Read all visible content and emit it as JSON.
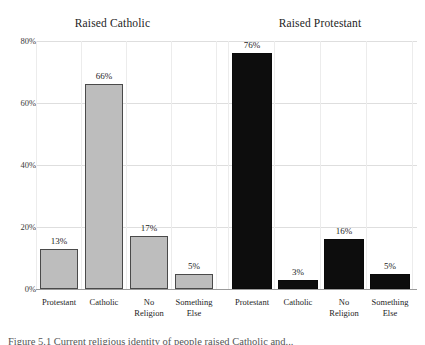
{
  "figure": {
    "caption": "Figure 5.1  Current religious identity of people raised Catholic and..."
  },
  "chart_data": {
    "type": "bar",
    "title": "",
    "xlabel": "",
    "ylabel": "",
    "ylim": [
      0,
      80
    ],
    "yticks": [
      "0%",
      "20%",
      "40%",
      "60%",
      "80%"
    ],
    "ytick_values": [
      0,
      20,
      40,
      60,
      80
    ],
    "grid": true,
    "grid_axis": "both",
    "legend": "none",
    "panels": [
      {
        "title": "Raised Catholic",
        "bar_color": "#bdbdbd",
        "categories": [
          "Protestant",
          "Catholic",
          "No Religion",
          "Something Else"
        ],
        "category_lines": [
          [
            "Protestant"
          ],
          [
            "Catholic"
          ],
          [
            "No",
            "Religion"
          ],
          [
            "Something",
            "Else"
          ]
        ],
        "values": [
          13,
          66,
          17,
          5
        ],
        "labels": [
          "13%",
          "66%",
          "17%",
          "5%"
        ]
      },
      {
        "title": "Raised Protestant",
        "bar_color": "#0d0d0d",
        "categories": [
          "Protestant",
          "Catholic",
          "No Religion",
          "Something Else"
        ],
        "category_lines": [
          [
            "Protestant"
          ],
          [
            "Catholic"
          ],
          [
            "No",
            "Religion"
          ],
          [
            "Something",
            "Else"
          ]
        ],
        "values": [
          76,
          3,
          16,
          5
        ],
        "labels": [
          "76%",
          "3%",
          "16%",
          "5%"
        ]
      }
    ]
  },
  "colors": {
    "bar_light": "#bdbdbd",
    "bar_dark": "#0d0d0d",
    "gridline": "#dedede",
    "axis": "#9a9a9a",
    "text": "#1d1d1d",
    "background": "#ffffff"
  }
}
